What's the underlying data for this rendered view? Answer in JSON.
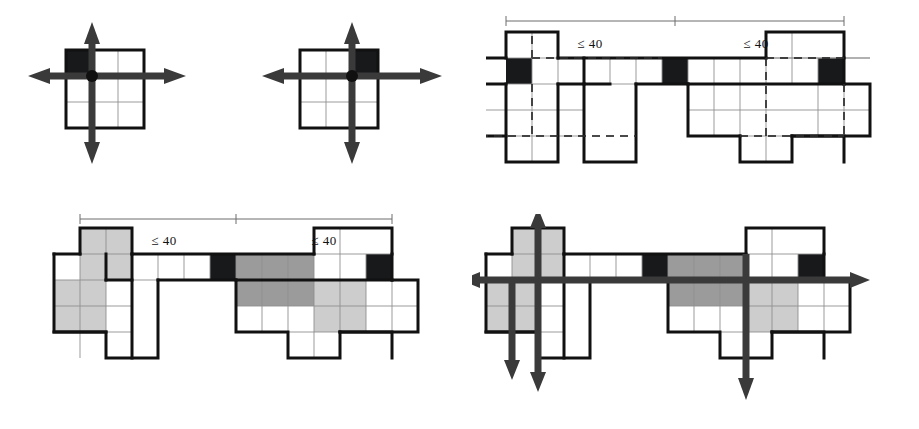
{
  "figure": {
    "dimension_label": "≤ 40",
    "colors": {
      "outline": "#111111",
      "gridline": "#909090",
      "black_cell": "#17191a",
      "gray_cell": "#9b9b9b",
      "light_cell": "#cdcdcd",
      "white_cell": "#ffffff",
      "arrow": "#3a3a3a",
      "dimension_line": "#6d6d6d",
      "background": "#ffffff"
    },
    "cell_size_px": 26,
    "panels": [
      {
        "id": "panel-top-left",
        "name": "three-by-three-grid-black-top-left",
        "origin": [
          66,
          50
        ],
        "grid_cols": 3,
        "grid_rows": 3,
        "black_cells": [
          [
            0,
            0
          ]
        ],
        "gray_cells": [],
        "light_cells": [],
        "axis_center_cell": [
          1,
          1
        ],
        "arrows": [
          "up",
          "down",
          "left",
          "right"
        ],
        "has_hub_dot": true,
        "dimension_labels": []
      },
      {
        "id": "panel-top-mid",
        "name": "three-by-three-grid-black-top-right",
        "origin": [
          300,
          50
        ],
        "grid_cols": 3,
        "grid_rows": 3,
        "black_cells": [
          [
            2,
            0
          ]
        ],
        "gray_cells": [],
        "light_cells": [],
        "axis_center_cell": [
          2,
          1
        ],
        "arrows": [
          "up",
          "down",
          "left",
          "right"
        ],
        "has_hub_dot": true,
        "dimension_labels": []
      },
      {
        "id": "panel-top-right",
        "name": "unfolded-net-plain",
        "origin": [
          506,
          32
        ],
        "black_cells": [
          [
            0,
            1
          ],
          [
            6,
            1
          ],
          [
            11,
            1
          ]
        ],
        "gray_cells": [],
        "light_cells": [],
        "arrows": [],
        "dimension_labels": [
          "≤ 40",
          "≤ 40"
        ]
      },
      {
        "id": "panel-bottom-left",
        "name": "unfolded-net-shaded",
        "origin": [
          74,
          236
        ],
        "black_cells": [
          [
            6,
            1
          ],
          [
            11,
            1
          ]
        ],
        "gray_cells": [
          [
            7,
            1
          ],
          [
            8,
            1
          ],
          [
            9,
            1
          ],
          [
            7,
            2
          ],
          [
            8,
            2
          ],
          [
            9,
            2
          ]
        ],
        "light_cells": [
          [
            1,
            0
          ],
          [
            2,
            0
          ],
          [
            1,
            1
          ],
          [
            2,
            1
          ],
          [
            0,
            2
          ],
          [
            1,
            2
          ],
          [
            0,
            3
          ],
          [
            1,
            3
          ],
          [
            10,
            2
          ],
          [
            11,
            2
          ],
          [
            10,
            3
          ],
          [
            11,
            3
          ]
        ],
        "arrows": [],
        "dimension_labels": [
          "≤ 40",
          "≤ 40"
        ]
      },
      {
        "id": "panel-bottom-right",
        "name": "unfolded-net-shaded-with-axes",
        "origin": [
          512,
          236
        ],
        "black_cells": [
          [
            6,
            1
          ],
          [
            11,
            1
          ]
        ],
        "gray_cells": [
          [
            7,
            1
          ],
          [
            8,
            1
          ],
          [
            9,
            1
          ],
          [
            7,
            2
          ],
          [
            8,
            2
          ],
          [
            9,
            2
          ]
        ],
        "light_cells": [
          [
            1,
            0
          ],
          [
            2,
            0
          ],
          [
            1,
            1
          ],
          [
            2,
            1
          ],
          [
            0,
            2
          ],
          [
            1,
            2
          ],
          [
            0,
            3
          ],
          [
            1,
            3
          ],
          [
            10,
            2
          ],
          [
            11,
            2
          ],
          [
            10,
            3
          ],
          [
            11,
            3
          ]
        ],
        "arrows": [
          "horizontal-left",
          "horizontal-right",
          "vertical-a-up",
          "vertical-a-down",
          "vertical-b-down",
          "vertical-c-down"
        ],
        "dimension_labels": []
      }
    ]
  }
}
